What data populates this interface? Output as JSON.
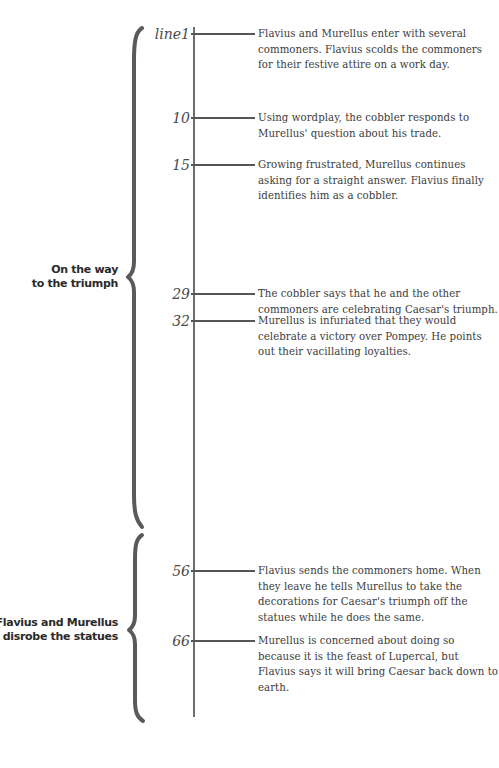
{
  "timeline": {
    "events": [
      {
        "line_label": "line1",
        "text": "Flavius and Murellus enter with several commoners. Flavius scolds the commoners for their festive attire on a work day."
      },
      {
        "line_label": "10",
        "text": "Using wordplay, the cobbler responds to Murellus' question about his trade."
      },
      {
        "line_label": "15",
        "text": "Growing frustrated, Murellus continues asking for a straight answer. Flavius finally identifies him as a cobbler."
      },
      {
        "line_label": "29",
        "text": "The cobbler says that he and the other commoners are celebrating Caesar's triumph."
      },
      {
        "line_label": "32",
        "text": "Murellus is infuriated that they would celebrate a victory over Pompey. He points out their vacillating loyalties."
      },
      {
        "line_label": "56",
        "text": "Flavius sends the commoners home. When they leave he tells Murellus to take the decorations for Caesar's triumph off the statues while he does the same."
      },
      {
        "line_label": "66",
        "text": "Murellus is concerned about doing so because it is the feast of Lupercal, but Flavius says it will bring Caesar back down to earth."
      }
    ],
    "sections": [
      {
        "line1": "On the way",
        "line2": "to the triumph"
      },
      {
        "line1": "Flavius and Murellus",
        "line2": "disrobe the statues"
      }
    ]
  },
  "colors": {
    "brace": "#5a5a5a",
    "axis": "#6e6e6e",
    "text": "#3c3c3c"
  }
}
